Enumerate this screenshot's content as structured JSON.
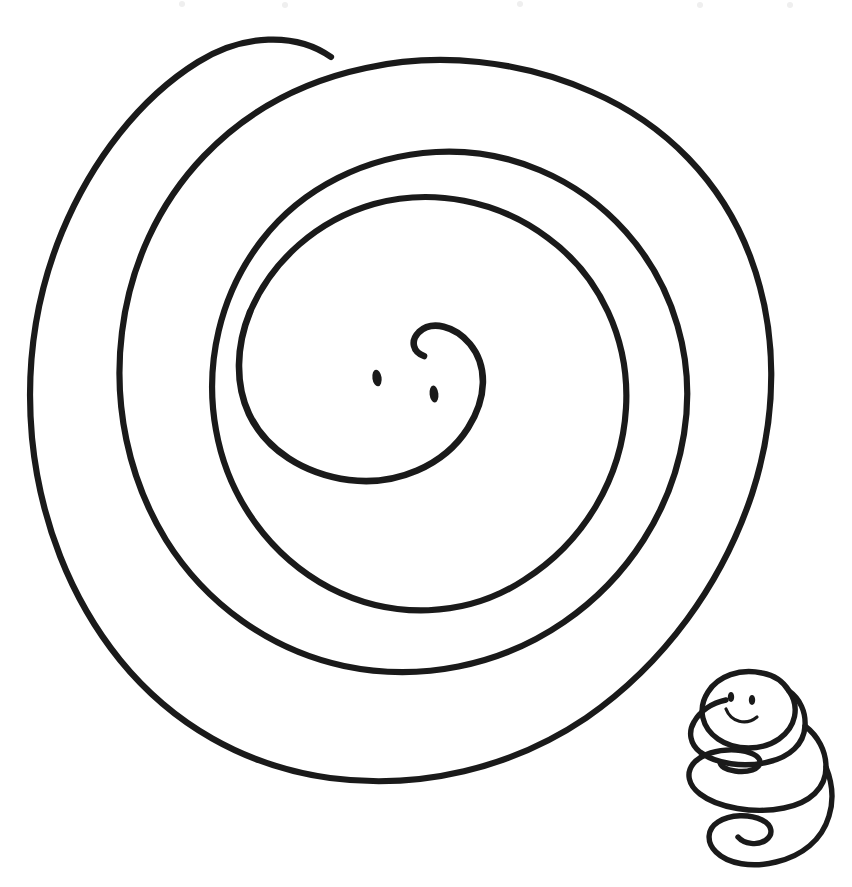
{
  "document": {
    "title": "Spiral Snake Line Drawing",
    "kind": "hand-drawn black-and-white line illustration",
    "background_color": "#ffffff",
    "ink_color": "#1a1a1a",
    "width": 852,
    "height": 887,
    "caption": ""
  },
  "figures": {
    "large_snake": {
      "name": "Large coiled spiral snake",
      "description": "A snake drawn as a single continuous line wound into a flat spiral of about three and a half turns, head at the centre, tail tip at the upper left.",
      "turns": 3.5,
      "head_label": "Snake head at spiral centre",
      "tail_label": "Tail tip at top",
      "eyes": 2,
      "stroke_width": 6.2,
      "bounds": {
        "x": 28,
        "y": 32,
        "width": 748,
        "height": 750
      }
    },
    "small_snake": {
      "name": "Small coiled snake",
      "description": "A smaller snake coiled vertically like a spring, head resting on top with two eyes and a smile, tail curling at the bottom.",
      "coils": 3,
      "head_label": "Small snake head",
      "eyes": 2,
      "has_smile": true,
      "stroke_width": 5.4,
      "bounds": {
        "x": 688,
        "y": 668,
        "width": 146,
        "height": 213
      }
    }
  },
  "annotations": {
    "text_labels": [],
    "note": "No text appears anywhere in the image."
  }
}
